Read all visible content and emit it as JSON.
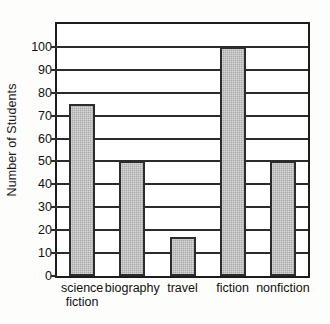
{
  "chart_data": {
    "type": "bar",
    "title": "",
    "subtitle": "",
    "xlabel": "",
    "ylabel": "Number of Students",
    "categories": [
      "science\nfiction",
      "biography",
      "travel",
      "fiction",
      "nonfiction"
    ],
    "values": [
      75,
      50,
      17,
      100,
      50
    ],
    "ylim": [
      0,
      110
    ],
    "y_ticks": [
      0,
      10,
      20,
      30,
      40,
      50,
      60,
      70,
      80,
      90,
      100
    ],
    "y_tick_labels": [
      "0",
      "10",
      "20",
      "30",
      "40",
      "50",
      "60",
      "70",
      "80",
      "90",
      "100"
    ],
    "grid": true,
    "grid_axis": "y",
    "legend": false,
    "legend_position": "none",
    "bar_color": "#a9a9a9",
    "bar_edge_color": "#2c2c2c",
    "axis_color": "#1c1c1c",
    "plot_background": "#ffffff",
    "figure_background": "#fdfdfb",
    "series": [
      {
        "name": "Students",
        "values": [
          75,
          50,
          17,
          100,
          50
        ]
      }
    ]
  }
}
